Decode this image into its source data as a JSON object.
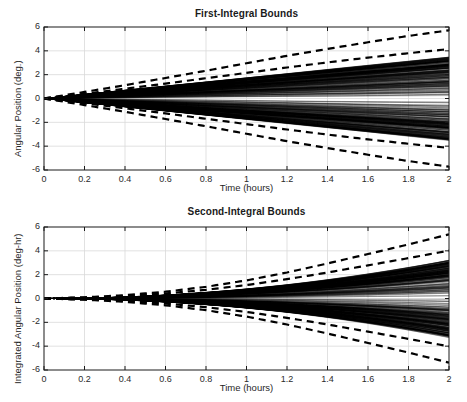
{
  "figure": {
    "width": 467,
    "height": 402,
    "background": "#ffffff",
    "axis_color": "#1a1a1a",
    "grid_color": "#d9d9d9",
    "trace_color": "#000000",
    "bound_color": "#000000"
  },
  "panels": [
    {
      "id": "first-integral",
      "title": "First-Integral Bounds",
      "xlabel": "Time (hours)",
      "ylabel": "Angular Position (deg.)"
    },
    {
      "id": "second-integral",
      "title": "Second-Integral Bounds",
      "xlabel": "Time (hours)",
      "ylabel": "Integrated Angular Position (deg-hr)"
    }
  ],
  "ticks": {
    "x": [
      "0",
      "0.2",
      "0.4",
      "0.6",
      "0.8",
      "1",
      "1.2",
      "1.4",
      "1.6",
      "1.8",
      "2"
    ],
    "y": [
      "6",
      "4",
      "2",
      "0",
      "-2",
      "-4",
      "-6"
    ]
  },
  "chart_data": [
    {
      "type": "line",
      "id": "first-integral",
      "title": "First-Integral Bounds",
      "xlabel": "Time (hours)",
      "ylabel": "Angular Position (deg.)",
      "xlim": [
        0,
        2
      ],
      "ylim": [
        -6,
        6
      ],
      "xticks": [
        0,
        0.2,
        0.4,
        0.6,
        0.8,
        1,
        1.2,
        1.4,
        1.6,
        1.8,
        2
      ],
      "yticks": [
        6,
        4,
        2,
        0,
        -2,
        -4,
        -6
      ],
      "grid": true,
      "legend": "none",
      "description": "Dense Monte-Carlo ensemble of angular-position trajectories fanning out linearly from the origin, overlaid with dashed analytic bound envelopes.",
      "x": [
        0,
        0.2,
        0.4,
        0.6,
        0.8,
        1.0,
        1.2,
        1.4,
        1.6,
        1.8,
        2.0
      ],
      "series": [
        {
          "name": "Outer bound (upper)",
          "style": "dashed",
          "values": [
            0.0,
            0.55,
            1.12,
            1.72,
            2.33,
            2.96,
            3.58,
            4.16,
            4.72,
            5.25,
            5.72
          ]
        },
        {
          "name": "Outer bound (lower)",
          "style": "dashed",
          "values": [
            0.0,
            -0.55,
            -1.12,
            -1.72,
            -2.33,
            -2.96,
            -3.58,
            -4.16,
            -4.72,
            -5.25,
            -5.72
          ]
        },
        {
          "name": "Inner bound (upper)",
          "style": "dashed",
          "values": [
            0.0,
            0.4,
            0.82,
            1.25,
            1.7,
            2.15,
            2.6,
            3.03,
            3.43,
            3.8,
            4.15
          ]
        },
        {
          "name": "Inner bound (lower)",
          "style": "dashed",
          "values": [
            0.0,
            -0.4,
            -0.82,
            -1.25,
            -1.7,
            -2.15,
            -2.6,
            -3.03,
            -3.43,
            -3.8,
            -4.15
          ]
        },
        {
          "name": "Ensemble envelope (upper)",
          "style": "solid-dense",
          "values": [
            0.0,
            0.33,
            0.68,
            1.03,
            1.4,
            1.76,
            2.12,
            2.46,
            2.78,
            3.08,
            3.35
          ]
        },
        {
          "name": "Ensemble envelope (lower)",
          "style": "solid-dense",
          "values": [
            0.0,
            -0.33,
            -0.68,
            -1.03,
            -1.4,
            -1.76,
            -2.12,
            -2.46,
            -2.78,
            -3.08,
            -3.35
          ]
        }
      ]
    },
    {
      "type": "line",
      "id": "second-integral",
      "title": "Second-Integral Bounds",
      "xlabel": "Time (hours)",
      "ylabel": "Integrated Angular Position (deg-hr)",
      "xlim": [
        0,
        2
      ],
      "ylim": [
        -6,
        6
      ],
      "xticks": [
        0,
        0.2,
        0.4,
        0.6,
        0.8,
        1,
        1.2,
        1.4,
        1.6,
        1.8,
        2
      ],
      "yticks": [
        6,
        4,
        2,
        0,
        -2,
        -4,
        -6
      ],
      "grid": true,
      "legend": "none",
      "description": "Dense Monte-Carlo ensemble of integrated angular-position trajectories with quadratic-like growth, overlaid with dashed analytic bound envelopes.",
      "x": [
        0,
        0.2,
        0.4,
        0.6,
        0.8,
        1.0,
        1.2,
        1.4,
        1.6,
        1.8,
        2.0
      ],
      "series": [
        {
          "name": "Outer bound (upper)",
          "style": "dashed",
          "values": [
            0.0,
            0.1,
            0.28,
            0.57,
            0.98,
            1.52,
            2.18,
            2.94,
            3.73,
            4.54,
            5.38
          ]
        },
        {
          "name": "Outer bound (lower)",
          "style": "dashed",
          "values": [
            0.0,
            -0.1,
            -0.28,
            -0.57,
            -0.98,
            -1.52,
            -2.18,
            -2.94,
            -3.73,
            -4.54,
            -5.38
          ]
        },
        {
          "name": "Inner bound (upper)",
          "style": "dashed",
          "values": [
            0.0,
            0.07,
            0.2,
            0.42,
            0.73,
            1.13,
            1.62,
            2.18,
            2.78,
            3.39,
            4.02
          ]
        },
        {
          "name": "Inner bound (lower)",
          "style": "dashed",
          "values": [
            0.0,
            -0.07,
            -0.2,
            -0.42,
            -0.73,
            -1.13,
            -1.62,
            -2.18,
            -2.78,
            -3.39,
            -4.02
          ]
        },
        {
          "name": "Ensemble envelope (upper)",
          "style": "solid-dense",
          "values": [
            0.0,
            0.05,
            0.15,
            0.32,
            0.56,
            0.87,
            1.25,
            1.68,
            2.14,
            2.62,
            3.1
          ]
        },
        {
          "name": "Ensemble envelope (lower)",
          "style": "solid-dense",
          "values": [
            0.0,
            -0.05,
            -0.15,
            -0.32,
            -0.56,
            -0.87,
            -1.25,
            -1.68,
            -2.14,
            -2.62,
            -3.1
          ]
        }
      ]
    }
  ]
}
